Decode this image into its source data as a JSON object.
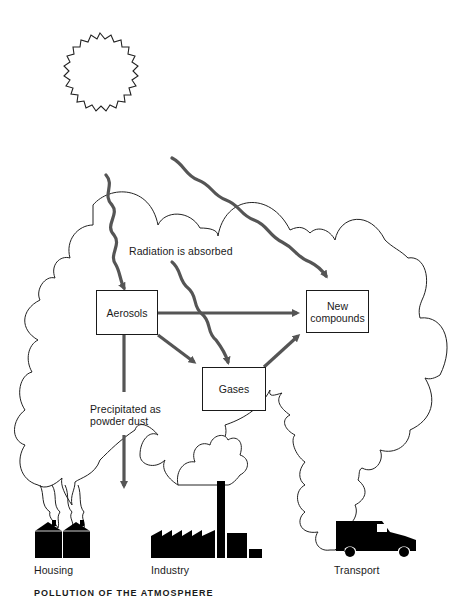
{
  "diagram": {
    "nodes": {
      "aerosols": "Aerosols",
      "new_compounds_line1": "New",
      "new_compounds_line2": "compounds",
      "gases": "Gases"
    },
    "labels": {
      "radiation": "Radiation is absorbed",
      "precipitated_line1": "Precipitated as",
      "precipitated_line2": "powder dust"
    },
    "sources": {
      "housing": "Housing",
      "industry": "Industry",
      "transport": "Transport"
    },
    "caption": "POLLUTION OF THE ATMOSPHERE",
    "edges": [
      {
        "from": "sun",
        "to": "aerosols",
        "style": "wavy"
      },
      {
        "from": "sun",
        "to": "new_compounds",
        "style": "wavy"
      },
      {
        "from": "sun",
        "to": "gases",
        "style": "wavy"
      },
      {
        "from": "aerosols",
        "to": "new_compounds",
        "style": "straight"
      },
      {
        "from": "aerosols",
        "to": "gases",
        "style": "straight"
      },
      {
        "from": "gases",
        "to": "new_compounds",
        "style": "straight"
      },
      {
        "from": "aerosols",
        "to": "ground",
        "style": "straight",
        "label": "Precipitated as powder dust"
      }
    ],
    "colors": {
      "arrow": "#555555",
      "outline": "#1a1a1a",
      "silhouette": "#000000"
    }
  }
}
